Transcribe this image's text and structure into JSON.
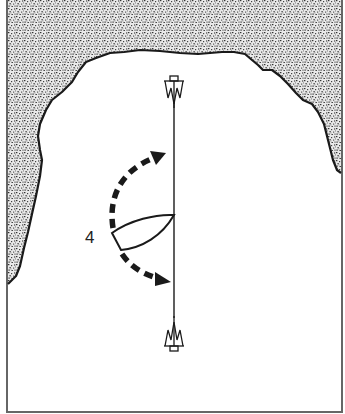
{
  "diagram": {
    "type": "sailing-maneuver-illustration",
    "position_label": "4",
    "elements": {
      "shore": "stippled land mass along top and left/right sides (cove)",
      "water": "white open area",
      "line": "vertical mooring line between two anchors",
      "anchors": [
        "top-anchor",
        "bottom-anchor"
      ],
      "boat": "boat hull with bow at mooring line",
      "arrows": [
        "dashed-arrow-up-right",
        "dashed-arrow-down-right"
      ]
    },
    "colors": {
      "ink": "#1a1a1a",
      "stipple": "#555555",
      "background": "#ffffff",
      "border": "#666666"
    }
  }
}
